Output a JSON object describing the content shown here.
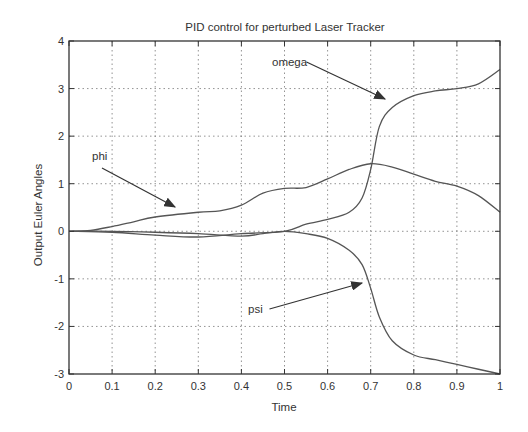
{
  "chart_data": {
    "type": "line",
    "title": "PID control for perturbed Laser Tracker",
    "xlabel": "Time",
    "ylabel": "Output Euler Angles",
    "xlim": [
      0,
      1
    ],
    "ylim": [
      -3,
      4
    ],
    "xticks": [
      "0",
      "0.1",
      "0.2",
      "0.3",
      "0.4",
      "0.5",
      "0.6",
      "0.7",
      "0.8",
      "0.9",
      "1"
    ],
    "yticks": [
      "-3",
      "-2",
      "-1",
      "0",
      "1",
      "2",
      "3",
      "4"
    ],
    "grid": true,
    "series": [
      {
        "name": "omega",
        "x": [
          0,
          0.1,
          0.2,
          0.3,
          0.4,
          0.5,
          0.55,
          0.6,
          0.65,
          0.68,
          0.7,
          0.72,
          0.75,
          0.8,
          0.85,
          0.9,
          0.95,
          1.0
        ],
        "values": [
          0,
          -0.02,
          -0.08,
          -0.12,
          -0.05,
          0.0,
          0.15,
          0.25,
          0.4,
          0.7,
          1.3,
          2.2,
          2.6,
          2.85,
          2.95,
          3.0,
          3.1,
          3.4
        ]
      },
      {
        "name": "phi",
        "x": [
          0,
          0.05,
          0.1,
          0.15,
          0.2,
          0.3,
          0.35,
          0.4,
          0.45,
          0.5,
          0.55,
          0.6,
          0.65,
          0.7,
          0.75,
          0.8,
          0.85,
          0.9,
          0.95,
          1.0
        ],
        "values": [
          0,
          0.02,
          0.1,
          0.2,
          0.3,
          0.4,
          0.43,
          0.55,
          0.8,
          0.9,
          0.92,
          1.1,
          1.3,
          1.42,
          1.35,
          1.2,
          1.05,
          0.95,
          0.75,
          0.4
        ]
      },
      {
        "name": "psi",
        "x": [
          0,
          0.1,
          0.2,
          0.3,
          0.4,
          0.45,
          0.5,
          0.55,
          0.6,
          0.65,
          0.68,
          0.7,
          0.72,
          0.75,
          0.8,
          0.85,
          0.9,
          0.95,
          1.0
        ],
        "values": [
          0,
          0.0,
          -0.02,
          -0.05,
          -0.1,
          -0.05,
          0.0,
          -0.05,
          -0.15,
          -0.4,
          -0.7,
          -1.2,
          -1.8,
          -2.3,
          -2.6,
          -2.7,
          -2.8,
          -2.9,
          -3.0
        ]
      }
    ],
    "annotations": [
      {
        "text": "omega",
        "label_xy": [
          272,
          66
        ],
        "arrow_to": [
          385,
          99
        ]
      },
      {
        "text": "phi",
        "label_xy": [
          92,
          160
        ],
        "arrow_to": [
          175,
          207
        ]
      },
      {
        "text": "psi",
        "label_xy": [
          248,
          313
        ],
        "arrow_to": [
          362,
          283
        ]
      }
    ],
    "legend": null
  }
}
